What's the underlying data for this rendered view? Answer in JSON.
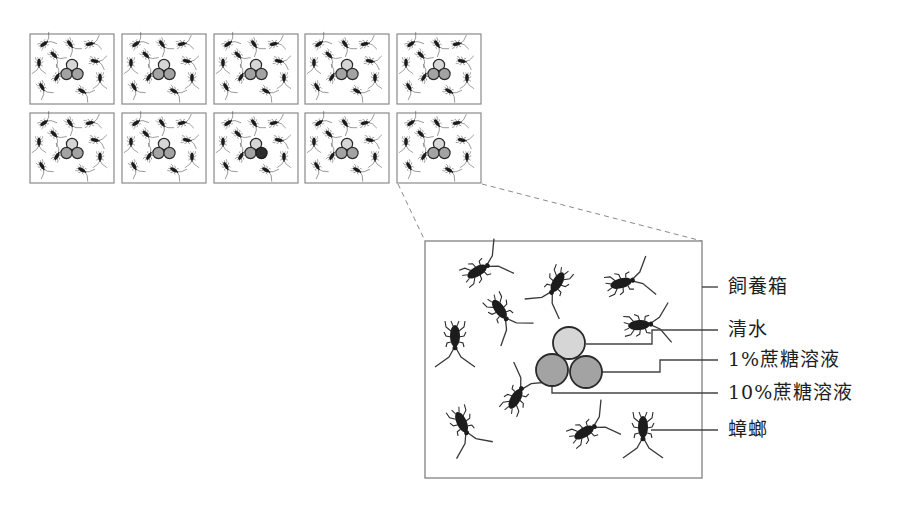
{
  "diagram": {
    "type": "experimental-setup",
    "grid": {
      "rows": 2,
      "cols": 5,
      "boxes": [
        {
          "id": 1,
          "circles": [
            "light",
            "medium",
            "medium"
          ]
        },
        {
          "id": 2,
          "circles": [
            "light",
            "medium",
            "medium"
          ]
        },
        {
          "id": 3,
          "circles": [
            "light",
            "medium",
            "medium"
          ]
        },
        {
          "id": 4,
          "circles": [
            "light",
            "medium",
            "medium"
          ]
        },
        {
          "id": 5,
          "circles": [
            "light",
            "medium",
            "medium"
          ]
        },
        {
          "id": 6,
          "circles": [
            "light",
            "medium",
            "medium"
          ]
        },
        {
          "id": 7,
          "circles": [
            "light",
            "medium",
            "medium"
          ]
        },
        {
          "id": 8,
          "circles": [
            "light",
            "medium",
            "dark"
          ]
        },
        {
          "id": 9,
          "circles": [
            "light",
            "medium",
            "medium"
          ]
        },
        {
          "id": 10,
          "circles": [
            "light",
            "medium",
            "medium"
          ]
        }
      ],
      "cockroaches_per_box": 10,
      "zoomed_box_index": 10
    },
    "detail": {
      "cockroach_count": 10,
      "labels": [
        {
          "key": "container",
          "text": "飼養箱"
        },
        {
          "key": "water",
          "text": "清水"
        },
        {
          "key": "sucrose_1",
          "text": "1%蔗糖溶液"
        },
        {
          "key": "sucrose_10",
          "text": "10%蔗糖溶液"
        },
        {
          "key": "cockroach",
          "text": "蟑螂"
        }
      ]
    },
    "colors": {
      "box_border": "#8a8a8a",
      "insect": "#1c1c1c",
      "circle_light": "#d6d6d6",
      "circle_medium": "#a3a3a3",
      "circle_dark": "#2e2e2e",
      "circle_stroke": "#2a2a2a",
      "leader_line": "#444444",
      "dashed_line": "#8a8a8a"
    }
  }
}
